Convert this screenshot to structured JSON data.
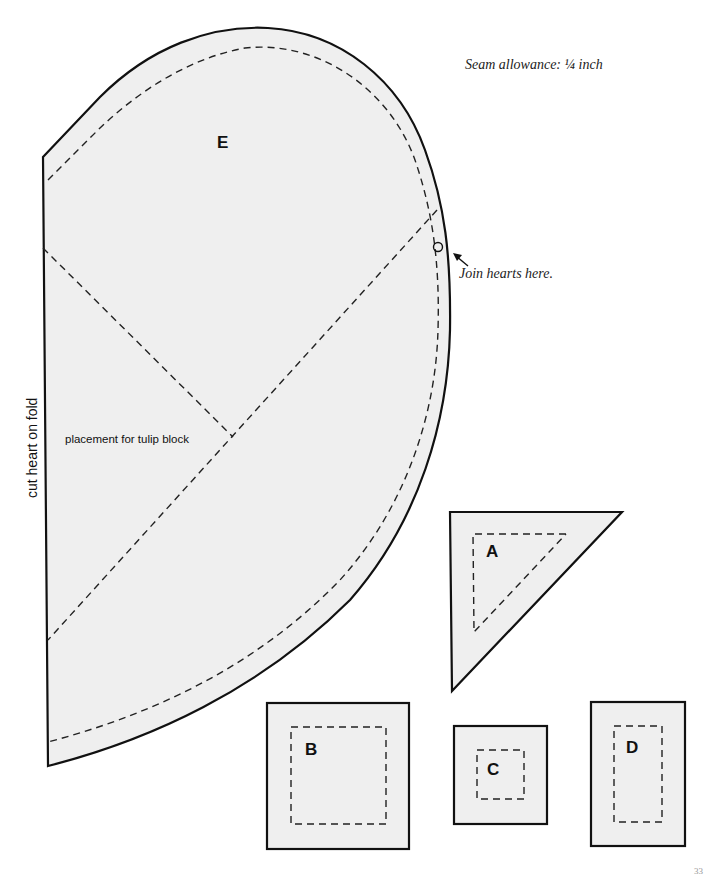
{
  "header": {
    "seam_allowance_note": "Seam allowance: ¼ inch"
  },
  "pieces": {
    "E": {
      "label": "E",
      "fold_note": "cut heart on fold",
      "placement_note": "placement for tulip block",
      "join_note": "Join hearts here.",
      "join_marker_icon": "circle-marker",
      "arrow_icon": "arrow-up-left"
    },
    "A": {
      "label": "A",
      "shape": "triangle"
    },
    "B": {
      "label": "B",
      "shape": "square"
    },
    "C": {
      "label": "C",
      "shape": "square"
    },
    "D": {
      "label": "D",
      "shape": "rectangle"
    }
  },
  "colors": {
    "piece_fill": "#efefef",
    "outline": "#111111",
    "background": "#ffffff"
  },
  "footer": {
    "page_number": "33"
  }
}
